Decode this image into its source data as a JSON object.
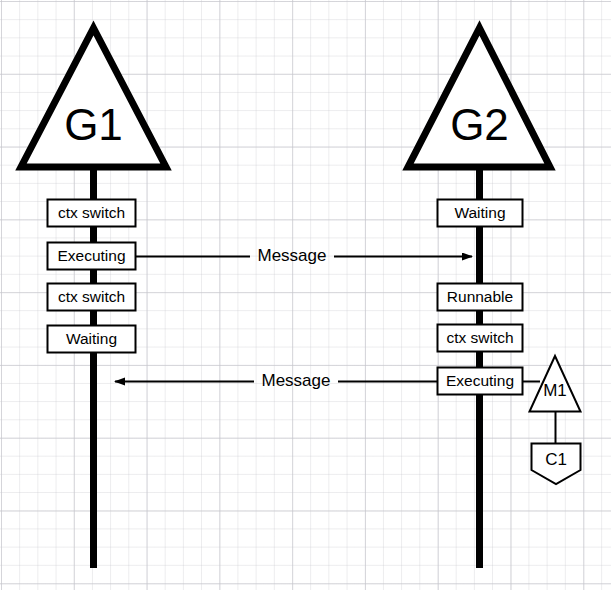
{
  "diagram": {
    "type": "sequence",
    "background": "#ffffff",
    "stroke": "#000000",
    "fill": "#ffffff"
  },
  "lifelines": [
    {
      "id": "g1",
      "label": "G1",
      "shape": "triangle",
      "x": 93,
      "states": [
        {
          "label": "ctx switch",
          "y": 213
        },
        {
          "label": "Executing",
          "y": 256
        },
        {
          "label": "ctx switch",
          "y": 297
        },
        {
          "label": "Waiting",
          "y": 339
        }
      ]
    },
    {
      "id": "g2",
      "label": "G2",
      "shape": "triangle",
      "x": 479,
      "states": [
        {
          "label": "Waiting",
          "y": 213
        },
        {
          "label": "Runnable",
          "y": 297
        },
        {
          "label": "ctx switch",
          "y": 338
        },
        {
          "label": "Executing",
          "y": 381
        }
      ]
    }
  ],
  "messages": [
    {
      "label": "Message",
      "from": "g1",
      "to": "g2",
      "direction": "right",
      "y": 256
    },
    {
      "label": "Message",
      "from": "g2",
      "to": "g1",
      "direction": "left",
      "y": 381
    }
  ],
  "attachments": [
    {
      "id": "m1",
      "label": "M1",
      "shape": "triangle",
      "cx": 555,
      "cy": 388
    },
    {
      "id": "c1",
      "label": "C1",
      "shape": "pentagon",
      "cx": 556,
      "cy": 461
    }
  ]
}
